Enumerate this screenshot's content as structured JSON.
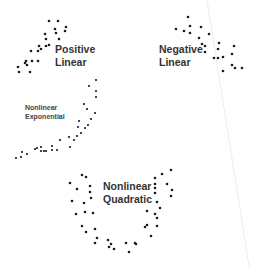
{
  "diagram": {
    "title": "",
    "panels": [
      {
        "id": "positive-linear",
        "label_line1": "Positive",
        "label_line2": "Linear"
      },
      {
        "id": "negative-linear",
        "label_line1": "Negative",
        "label_line2": "Linear"
      },
      {
        "id": "nonlinear-exponential",
        "label_line1": "Nonlinear",
        "label_line2": "Exponential"
      },
      {
        "id": "nonlinear-quadratic",
        "label_line1": "Nonlinear",
        "label_line2": "Quadratic"
      }
    ],
    "colors": {
      "point": "#1a1a1a",
      "text": "#333333",
      "background": "#ffffff",
      "divider": "#e6e6e6"
    }
  }
}
